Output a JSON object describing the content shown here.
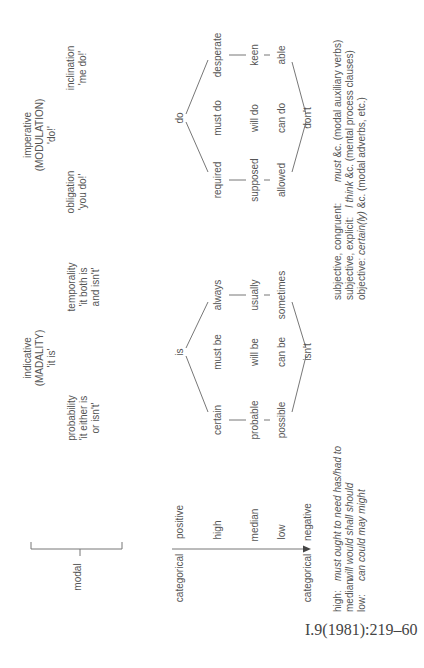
{
  "headers": {
    "modality_block": {
      "title": "indicative",
      "subtitle": "(MADALITY)",
      "gloss": "'it is'"
    },
    "modulation_block": {
      "title": "imperative",
      "subtitle": "(MODULATION)",
      "gloss": "'do!'"
    },
    "probability": {
      "line1": "probability",
      "line2": "'it either is",
      "line3": "or isn't'"
    },
    "temporality": {
      "line1": "temporality",
      "line2": "'it both is",
      "line3": "and isn't'"
    },
    "obligation": {
      "line1": "obligation",
      "line2": "'you do!'"
    },
    "inclination": {
      "line1": "inclination",
      "line2": "'me do!'"
    }
  },
  "left_axis": {
    "modal": "modal",
    "categorical_top": "categorical",
    "categorical_bottom": "categorical",
    "positive": "positive",
    "high": "high",
    "median": "median",
    "low": "low",
    "negative": "negative"
  },
  "modality": {
    "positive": "is",
    "negative": "isn't",
    "rows": [
      [
        "certain",
        "must be",
        "always"
      ],
      [
        "probable",
        "will be",
        "usually"
      ],
      [
        "possible",
        "can be",
        "sometimes"
      ]
    ]
  },
  "modulation": {
    "positive": "do",
    "negative": "don't",
    "rows": [
      [
        "required",
        "must do",
        "desperate"
      ],
      [
        "supposed",
        "will do",
        "keen"
      ],
      [
        "allowed",
        "can do",
        "able"
      ]
    ]
  },
  "key_values": [
    {
      "label": "high:",
      "value": "must ought to need has/had to"
    },
    {
      "label": "median:",
      "value": "will would shall should"
    },
    {
      "label": "low:",
      "value": "can could may might"
    }
  ],
  "key_orientation": [
    {
      "label": "subjective, congruent:",
      "em": "must",
      "rest": " &c. (modal auxiliary verbs)"
    },
    {
      "label": "subjective, explicit:",
      "em": "I think",
      "rest": " &c. (mental process clauses)"
    },
    {
      "label": "objective:",
      "em": "certain(ly)",
      "rest": " &c. (modal adverbs, etc.)"
    }
  ],
  "citation": "I.9(1981):219–60"
}
